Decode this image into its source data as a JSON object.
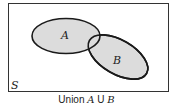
{
  "diagram": {
    "type": "venn",
    "universe_label": "S",
    "sets": [
      {
        "label": "A",
        "fill": "#dcdcdc"
      },
      {
        "label": "B",
        "fill": "#dcdcdc"
      }
    ],
    "caption": {
      "prefix": "Union ",
      "set_a": "A",
      "operator": " U ",
      "set_b": "B"
    },
    "colors": {
      "stroke": "#1a1a1a",
      "fill": "#dcdcdc",
      "background": "#ffffff"
    }
  }
}
